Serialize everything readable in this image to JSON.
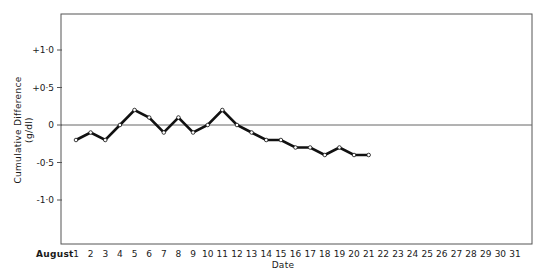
{
  "chart_data": {
    "type": "line",
    "title": "",
    "xlabel": "Date",
    "ylabel": "Cumulative Difference",
    "ylabel_units": "(g/dl)",
    "x_prefix_label": "August",
    "x": [
      1,
      2,
      3,
      4,
      5,
      6,
      7,
      8,
      9,
      10,
      11,
      12,
      13,
      14,
      15,
      16,
      17,
      18,
      19,
      20,
      21
    ],
    "x_ticks": [
      "1",
      "2",
      "3",
      "4",
      "5",
      "6",
      "7",
      "8",
      "9",
      "10",
      "11",
      "12",
      "13",
      "14",
      "15",
      "16",
      "17",
      "18",
      "19",
      "20",
      "21",
      "22",
      "23",
      "24",
      "25",
      "26",
      "27",
      "28",
      "29",
      "30",
      "31"
    ],
    "series": [
      {
        "name": "Cumulative Difference",
        "values": [
          -0.2,
          -0.1,
          -0.2,
          0.0,
          0.2,
          0.1,
          -0.1,
          0.1,
          -0.1,
          0.0,
          0.2,
          0.0,
          -0.1,
          -0.2,
          -0.2,
          -0.3,
          -0.3,
          -0.4,
          -0.3,
          -0.4,
          -0.4
        ],
        "marker": "open-circle",
        "color": "#111111"
      }
    ],
    "y_ticks": [
      {
        "value": 1.0,
        "label": "+1·0"
      },
      {
        "value": 0.5,
        "label": "+0·5"
      },
      {
        "value": 0.0,
        "label": "0"
      },
      {
        "value": -0.5,
        "label": "-0·5"
      },
      {
        "value": -1.0,
        "label": "-1·0"
      }
    ],
    "xlim": [
      1,
      31
    ],
    "ylim": [
      -1.5,
      1.5
    ],
    "reference_line": 0,
    "grid": false,
    "legend": null
  }
}
